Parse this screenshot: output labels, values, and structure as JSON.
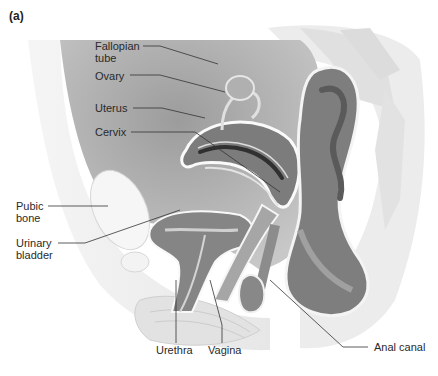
{
  "figure": {
    "panel_label": "(a)",
    "labels": {
      "fallopian_tube": "Fallopian\ntube",
      "ovary": "Ovary",
      "uterus": "Uterus",
      "cervix": "Cervix",
      "pubic_bone": "Pubic\nbone",
      "urinary_bladder": "Urinary\nbladder",
      "urethra": "Urethra",
      "vagina": "Vagina",
      "anal_canal": "Anal canal"
    },
    "colors": {
      "background": "#ffffff",
      "organ_dark": "#7a7a7a",
      "organ_mid": "#9a9a9a",
      "cavity": "#b8b8b8",
      "tissue_light": "#e8e8e8",
      "bone": "#f2f2f2",
      "leader_line": "#333333",
      "label_text": "#2a2a2a"
    }
  }
}
